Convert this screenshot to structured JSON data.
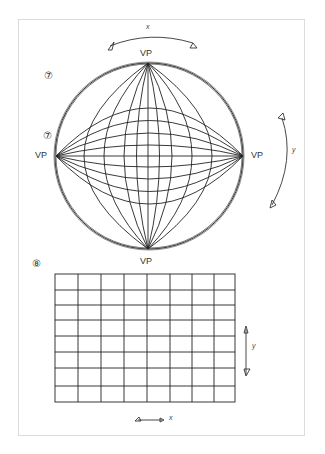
{
  "figure7": {
    "step_label": "⑦",
    "step_label_2": "⑦",
    "vp_top": "VP",
    "vp_left": "VP",
    "vp_right": "VP",
    "vp_bottom": "VP",
    "axis_x": "x",
    "axis_y": "y"
  },
  "figure8": {
    "step_label": "⑧",
    "grid": {
      "columns": 8,
      "rows": 8
    },
    "axis_x": "x",
    "axis_y": "y"
  }
}
